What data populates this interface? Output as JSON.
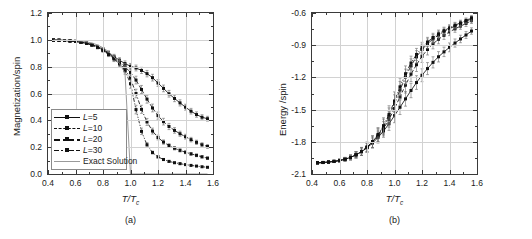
{
  "figure": {
    "panels": [
      {
        "caption": "(a)",
        "y_axis_title": "Magnetization/spin",
        "x_axis_title_main": "T/T",
        "x_axis_title_sub": "c"
      },
      {
        "caption": "(b)",
        "y_axis_title": "Energy /spin",
        "x_axis_title_main": "T/T",
        "x_axis_title_sub": "c"
      }
    ]
  },
  "chart_data": [
    {
      "type": "line",
      "panel": "(a)",
      "title": "",
      "xlabel": "T/Tc",
      "ylabel": "Magnetization/spin",
      "xlim": [
        0.4,
        1.6
      ],
      "ylim": [
        0.0,
        1.2
      ],
      "xticks": [
        "0.4",
        "0.6",
        "0.8",
        "1.0",
        "1.2",
        "1.4",
        "1.6"
      ],
      "yticks": [
        "0.0",
        "0.2",
        "0.4",
        "0.6",
        "0.8",
        "1.0",
        "1.2"
      ],
      "xtick_values": [
        0.4,
        0.6,
        0.8,
        1.0,
        1.2,
        1.4,
        1.6
      ],
      "ytick_values": [
        0.0,
        0.2,
        0.4,
        0.6,
        0.8,
        1.0,
        1.2
      ],
      "grid": true,
      "legend_position": "lower-left",
      "errorbars": true,
      "x": [
        0.44,
        0.48,
        0.52,
        0.56,
        0.6,
        0.64,
        0.68,
        0.72,
        0.76,
        0.8,
        0.84,
        0.88,
        0.92,
        0.96,
        1.0,
        1.04,
        1.08,
        1.12,
        1.16,
        1.2,
        1.24,
        1.28,
        1.32,
        1.36,
        1.4,
        1.44,
        1.48,
        1.52,
        1.56
      ],
      "series": [
        {
          "name": "L=5",
          "linestyle": "solid",
          "values": [
            0.998,
            0.997,
            0.995,
            0.992,
            0.989,
            0.983,
            0.975,
            0.965,
            0.95,
            0.93,
            0.903,
            0.875,
            0.848,
            0.823,
            0.803,
            0.79,
            0.772,
            0.748,
            0.718,
            0.678,
            0.638,
            0.598,
            0.563,
            0.53,
            0.498,
            0.468,
            0.443,
            0.423,
            0.412
          ],
          "errors": [
            0.004,
            0.004,
            0.005,
            0.005,
            0.006,
            0.007,
            0.008,
            0.009,
            0.011,
            0.013,
            0.015,
            0.017,
            0.019,
            0.02,
            0.021,
            0.022,
            0.023,
            0.024,
            0.025,
            0.025,
            0.025,
            0.025,
            0.024,
            0.023,
            0.022,
            0.021,
            0.02,
            0.019,
            0.018
          ]
        },
        {
          "name": "L=10",
          "linestyle": "dashed",
          "values": [
            0.998,
            0.997,
            0.995,
            0.992,
            0.988,
            0.982,
            0.974,
            0.963,
            0.947,
            0.926,
            0.898,
            0.868,
            0.836,
            0.8,
            0.757,
            0.7,
            0.63,
            0.558,
            0.492,
            0.435,
            0.39,
            0.354,
            0.325,
            0.3,
            0.278,
            0.256,
            0.236,
            0.218,
            0.205
          ],
          "errors": [
            0.004,
            0.004,
            0.005,
            0.005,
            0.006,
            0.007,
            0.008,
            0.009,
            0.011,
            0.013,
            0.016,
            0.018,
            0.021,
            0.024,
            0.027,
            0.029,
            0.03,
            0.03,
            0.029,
            0.027,
            0.025,
            0.023,
            0.021,
            0.019,
            0.018,
            0.017,
            0.016,
            0.015,
            0.014
          ]
        },
        {
          "name": "L=20",
          "linestyle": "dashdot",
          "values": [
            0.998,
            0.997,
            0.995,
            0.992,
            0.988,
            0.982,
            0.974,
            0.962,
            0.945,
            0.923,
            0.894,
            0.862,
            0.826,
            0.782,
            0.712,
            0.6,
            0.482,
            0.388,
            0.32,
            0.272,
            0.238,
            0.212,
            0.192,
            0.176,
            0.162,
            0.15,
            0.139,
            0.128,
            0.118
          ],
          "errors": [
            0.004,
            0.004,
            0.005,
            0.005,
            0.006,
            0.007,
            0.008,
            0.009,
            0.011,
            0.013,
            0.016,
            0.019,
            0.022,
            0.026,
            0.03,
            0.032,
            0.03,
            0.026,
            0.022,
            0.018,
            0.016,
            0.014,
            0.013,
            0.012,
            0.011,
            0.01,
            0.01,
            0.009,
            0.009
          ]
        },
        {
          "name": "L=30",
          "linestyle": "dashdotdot",
          "values": [
            0.998,
            0.997,
            0.995,
            0.992,
            0.988,
            0.982,
            0.973,
            0.961,
            0.944,
            0.921,
            0.891,
            0.858,
            0.82,
            0.772,
            0.672,
            0.48,
            0.318,
            0.218,
            0.16,
            0.128,
            0.108,
            0.094,
            0.084,
            0.077,
            0.07,
            0.064,
            0.059,
            0.054,
            0.05
          ],
          "errors": [
            0.004,
            0.004,
            0.005,
            0.005,
            0.006,
            0.007,
            0.008,
            0.009,
            0.011,
            0.013,
            0.016,
            0.02,
            0.024,
            0.028,
            0.033,
            0.032,
            0.024,
            0.016,
            0.011,
            0.009,
            0.008,
            0.007,
            0.006,
            0.006,
            0.005,
            0.005,
            0.005,
            0.004,
            0.004
          ]
        },
        {
          "name": "Exact Solution",
          "linestyle": "plain-gray",
          "values": [
            0.999,
            0.999,
            0.998,
            0.997,
            0.995,
            0.991,
            0.985,
            0.976,
            0.962,
            0.941,
            0.912,
            0.874,
            0.824,
            0.752,
            0.0,
            0.0,
            0.0,
            0.0,
            0.0,
            0.0,
            0.0,
            0.0,
            0.0,
            0.0,
            0.0,
            0.0,
            0.0,
            0.0,
            0.0
          ],
          "errors": null
        }
      ],
      "legend_entries": [
        "L=5",
        "L=10",
        "L=20",
        "L=30",
        "Exact Solution"
      ]
    },
    {
      "type": "line",
      "panel": "(b)",
      "title": "",
      "xlabel": "T/Tc",
      "ylabel": "Energy /spin",
      "xlim": [
        0.4,
        1.6
      ],
      "ylim": [
        -2.1,
        -0.6
      ],
      "xticks": [
        "0.4",
        "0.6",
        "0.8",
        "1.0",
        "1.2",
        "1.4",
        "1.6"
      ],
      "yticks": [
        "-2.1",
        "-1.8",
        "-1.5",
        "-1.2",
        "-0.9",
        "-0.6"
      ],
      "xtick_values": [
        0.4,
        0.6,
        0.8,
        1.0,
        1.2,
        1.4,
        1.6
      ],
      "ytick_values": [
        -2.1,
        -1.8,
        -1.5,
        -1.2,
        -0.9,
        -0.6
      ],
      "grid": true,
      "legend_position": "lower-right",
      "errorbars": true,
      "x": [
        0.44,
        0.48,
        0.52,
        0.56,
        0.6,
        0.64,
        0.68,
        0.72,
        0.76,
        0.8,
        0.84,
        0.88,
        0.92,
        0.96,
        1.0,
        1.04,
        1.08,
        1.12,
        1.16,
        1.2,
        1.24,
        1.28,
        1.32,
        1.36,
        1.4,
        1.44,
        1.48,
        1.52,
        1.56
      ],
      "series": [
        {
          "name": "L=5",
          "linestyle": "solid",
          "values": [
            -1.995,
            -1.992,
            -1.988,
            -1.982,
            -1.974,
            -1.962,
            -1.945,
            -1.922,
            -1.893,
            -1.856,
            -1.812,
            -1.76,
            -1.7,
            -1.632,
            -1.556,
            -1.478,
            -1.4,
            -1.322,
            -1.248,
            -1.18,
            -1.118,
            -1.06,
            -1.008,
            -0.962,
            -0.92,
            -0.88,
            -0.842,
            -0.805,
            -0.768
          ],
          "errors": [
            0.006,
            0.007,
            0.008,
            0.01,
            0.013,
            0.017,
            0.022,
            0.028,
            0.034,
            0.04,
            0.046,
            0.052,
            0.058,
            0.062,
            0.066,
            0.068,
            0.068,
            0.067,
            0.064,
            0.06,
            0.056,
            0.052,
            0.048,
            0.044,
            0.041,
            0.038,
            0.035,
            0.032,
            0.03
          ]
        },
        {
          "name": "L=10",
          "linestyle": "dashed",
          "values": [
            -1.996,
            -1.993,
            -1.989,
            -1.983,
            -1.975,
            -1.963,
            -1.946,
            -1.922,
            -1.892,
            -1.853,
            -1.806,
            -1.748,
            -1.678,
            -1.592,
            -1.49,
            -1.382,
            -1.272,
            -1.17,
            -1.082,
            -1.004,
            -0.94,
            -0.888,
            -0.845,
            -0.808,
            -0.776,
            -0.748,
            -0.722,
            -0.698,
            -0.672
          ],
          "errors": [
            0.006,
            0.007,
            0.008,
            0.01,
            0.013,
            0.017,
            0.022,
            0.028,
            0.035,
            0.042,
            0.05,
            0.058,
            0.066,
            0.072,
            0.076,
            0.077,
            0.074,
            0.069,
            0.063,
            0.057,
            0.051,
            0.046,
            0.042,
            0.038,
            0.035,
            0.032,
            0.03,
            0.028,
            0.026
          ]
        },
        {
          "name": "L=20",
          "linestyle": "dashdot",
          "values": [
            -1.996,
            -1.993,
            -1.989,
            -1.983,
            -1.975,
            -1.963,
            -1.946,
            -1.921,
            -1.89,
            -1.85,
            -1.8,
            -1.738,
            -1.66,
            -1.562,
            -1.444,
            -1.318,
            -1.196,
            -1.092,
            -1.008,
            -0.94,
            -0.886,
            -0.842,
            -0.806,
            -0.774,
            -0.746,
            -0.722,
            -0.7,
            -0.678,
            -0.655
          ],
          "errors": [
            0.006,
            0.007,
            0.008,
            0.01,
            0.013,
            0.017,
            0.022,
            0.029,
            0.036,
            0.044,
            0.053,
            0.062,
            0.071,
            0.078,
            0.082,
            0.08,
            0.073,
            0.065,
            0.057,
            0.05,
            0.045,
            0.04,
            0.036,
            0.033,
            0.03,
            0.028,
            0.026,
            0.024,
            0.023
          ]
        },
        {
          "name": "L=30",
          "linestyle": "dashdotdot",
          "values": [
            -1.996,
            -1.993,
            -1.989,
            -1.983,
            -1.975,
            -1.963,
            -1.946,
            -1.921,
            -1.889,
            -1.848,
            -1.797,
            -1.732,
            -1.65,
            -1.546,
            -1.42,
            -1.288,
            -1.166,
            -1.066,
            -0.986,
            -0.922,
            -0.87,
            -0.828,
            -0.794,
            -0.764,
            -0.738,
            -0.714,
            -0.692,
            -0.67,
            -0.645
          ],
          "errors": [
            0.006,
            0.007,
            0.008,
            0.01,
            0.013,
            0.017,
            0.023,
            0.029,
            0.037,
            0.046,
            0.055,
            0.065,
            0.074,
            0.082,
            0.085,
            0.081,
            0.073,
            0.064,
            0.056,
            0.049,
            0.043,
            0.039,
            0.035,
            0.032,
            0.029,
            0.027,
            0.025,
            0.024,
            0.022
          ]
        }
      ],
      "legend_entries": [
        "L=5",
        "L=10",
        "L=20",
        "L=30"
      ]
    }
  ]
}
